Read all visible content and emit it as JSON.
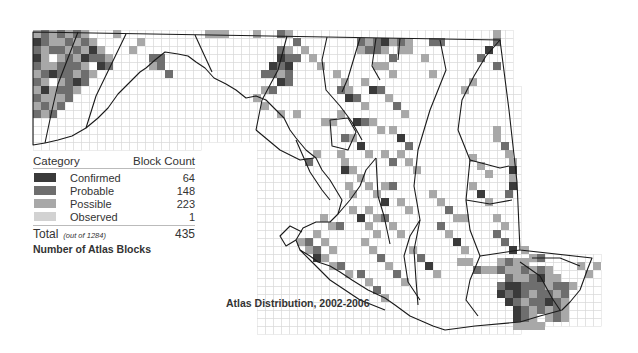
{
  "legend": {
    "header_category": "Category",
    "header_count": "Block Count",
    "rows": [
      {
        "label": "Confirmed",
        "count": "64",
        "color": "#3a3a3a"
      },
      {
        "label": "Probable",
        "count": "148",
        "color": "#6e6e6e"
      },
      {
        "label": "Possible",
        "count": "223",
        "color": "#a8a8a8"
      },
      {
        "label": "Observed",
        "count": "1",
        "color": "#d2d2d2"
      }
    ],
    "total_label": "Total",
    "total_sub": "(out of 1284)",
    "total_count": "435",
    "caption": "Number of Atlas Blocks"
  },
  "map": {
    "caption": "Atlas Distribution, 2002-2006",
    "grid_color": "#d9d9d9",
    "outline_color": "#1a1a1a",
    "cell_size": 8,
    "category_colors": {
      "C": "#3a3a3a",
      "P": "#6e6e6e",
      "S": "#a8a8a8",
      "O": "#d2d2d2"
    },
    "blocks": [
      [
        33,
        30,
        "S"
      ],
      [
        41,
        30,
        "P"
      ],
      [
        49,
        30,
        "S"
      ],
      [
        57,
        30,
        "P"
      ],
      [
        65,
        30,
        "S"
      ],
      [
        73,
        30,
        "P"
      ],
      [
        81,
        30,
        "S"
      ],
      [
        33,
        38,
        "C"
      ],
      [
        41,
        38,
        "P"
      ],
      [
        49,
        38,
        "S"
      ],
      [
        57,
        38,
        "S"
      ],
      [
        65,
        38,
        "P"
      ],
      [
        73,
        38,
        "S"
      ],
      [
        81,
        38,
        "P"
      ],
      [
        89,
        38,
        "S"
      ],
      [
        33,
        46,
        "P"
      ],
      [
        41,
        46,
        "S"
      ],
      [
        49,
        46,
        "P"
      ],
      [
        57,
        46,
        "P"
      ],
      [
        65,
        46,
        "S"
      ],
      [
        73,
        46,
        "P"
      ],
      [
        81,
        46,
        "S"
      ],
      [
        89,
        46,
        "C"
      ],
      [
        97,
        46,
        "S"
      ],
      [
        33,
        54,
        "C"
      ],
      [
        41,
        54,
        "S"
      ],
      [
        57,
        54,
        "S"
      ],
      [
        65,
        54,
        "P"
      ],
      [
        73,
        54,
        "S"
      ],
      [
        81,
        54,
        "C"
      ],
      [
        89,
        54,
        "P"
      ],
      [
        97,
        54,
        "P"
      ],
      [
        105,
        54,
        "S"
      ],
      [
        33,
        62,
        "P"
      ],
      [
        41,
        62,
        "S"
      ],
      [
        49,
        62,
        "S"
      ],
      [
        57,
        62,
        "P"
      ],
      [
        65,
        62,
        "P"
      ],
      [
        73,
        62,
        "P"
      ],
      [
        81,
        62,
        "S"
      ],
      [
        97,
        62,
        "C"
      ],
      [
        105,
        62,
        "P"
      ],
      [
        33,
        70,
        "S"
      ],
      [
        41,
        70,
        "P"
      ],
      [
        49,
        70,
        "C"
      ],
      [
        57,
        70,
        "P"
      ],
      [
        65,
        70,
        "P"
      ],
      [
        73,
        70,
        "S"
      ],
      [
        81,
        70,
        "P"
      ],
      [
        89,
        70,
        "S"
      ],
      [
        33,
        78,
        "P"
      ],
      [
        41,
        78,
        "S"
      ],
      [
        57,
        78,
        "S"
      ],
      [
        65,
        78,
        "P"
      ],
      [
        73,
        78,
        "C"
      ],
      [
        81,
        78,
        "P"
      ],
      [
        33,
        86,
        "S"
      ],
      [
        41,
        86,
        "C"
      ],
      [
        49,
        86,
        "S"
      ],
      [
        57,
        86,
        "P"
      ],
      [
        65,
        86,
        "P"
      ],
      [
        73,
        86,
        "S"
      ],
      [
        33,
        94,
        "P"
      ],
      [
        41,
        94,
        "S"
      ],
      [
        49,
        94,
        "S"
      ],
      [
        57,
        94,
        "S"
      ],
      [
        65,
        94,
        "P"
      ],
      [
        33,
        102,
        "S"
      ],
      [
        41,
        102,
        "P"
      ],
      [
        49,
        102,
        "S"
      ],
      [
        57,
        102,
        "P"
      ],
      [
        33,
        110,
        "P"
      ],
      [
        41,
        110,
        "S"
      ],
      [
        49,
        110,
        "P"
      ],
      [
        113,
        30,
        "S"
      ],
      [
        129,
        46,
        "S"
      ],
      [
        137,
        38,
        "S"
      ],
      [
        149,
        54,
        "P"
      ],
      [
        157,
        54,
        "P"
      ],
      [
        149,
        62,
        "S"
      ],
      [
        157,
        62,
        "P"
      ],
      [
        165,
        70,
        "P"
      ],
      [
        205,
        30,
        "S"
      ],
      [
        213,
        30,
        "S"
      ],
      [
        221,
        30,
        "S"
      ],
      [
        253,
        30,
        "S"
      ],
      [
        277,
        30,
        "P"
      ],
      [
        285,
        30,
        "S"
      ],
      [
        293,
        38,
        "P"
      ],
      [
        277,
        46,
        "P"
      ],
      [
        285,
        46,
        "S"
      ],
      [
        277,
        54,
        "C"
      ],
      [
        285,
        54,
        "P"
      ],
      [
        293,
        54,
        "P"
      ],
      [
        269,
        62,
        "C"
      ],
      [
        277,
        62,
        "P"
      ],
      [
        285,
        62,
        "C"
      ],
      [
        261,
        70,
        "P"
      ],
      [
        269,
        70,
        "P"
      ],
      [
        277,
        70,
        "S"
      ],
      [
        285,
        70,
        "P"
      ],
      [
        277,
        78,
        "C"
      ],
      [
        285,
        78,
        "P"
      ],
      [
        261,
        86,
        "S"
      ],
      [
        269,
        86,
        "P"
      ],
      [
        253,
        94,
        "S"
      ],
      [
        261,
        102,
        "S"
      ],
      [
        277,
        110,
        "S"
      ],
      [
        293,
        110,
        "S"
      ],
      [
        301,
        46,
        "S"
      ],
      [
        309,
        54,
        "S"
      ],
      [
        317,
        62,
        "S"
      ],
      [
        333,
        70,
        "S"
      ],
      [
        341,
        78,
        "S"
      ],
      [
        357,
        38,
        "P"
      ],
      [
        365,
        38,
        "S"
      ],
      [
        373,
        38,
        "P"
      ],
      [
        381,
        38,
        "C"
      ],
      [
        389,
        38,
        "S"
      ],
      [
        397,
        38,
        "P"
      ],
      [
        405,
        38,
        "S"
      ],
      [
        429,
        38,
        "P"
      ],
      [
        437,
        38,
        "P"
      ],
      [
        357,
        46,
        "S"
      ],
      [
        365,
        46,
        "P"
      ],
      [
        373,
        46,
        "P"
      ],
      [
        381,
        46,
        "S"
      ],
      [
        389,
        54,
        "P"
      ],
      [
        397,
        46,
        "S"
      ],
      [
        405,
        46,
        "S"
      ],
      [
        373,
        62,
        "S"
      ],
      [
        381,
        62,
        "S"
      ],
      [
        389,
        70,
        "S"
      ],
      [
        421,
        54,
        "S"
      ],
      [
        429,
        70,
        "S"
      ],
      [
        461,
        86,
        "S"
      ],
      [
        469,
        78,
        "S"
      ],
      [
        493,
        30,
        "S"
      ],
      [
        493,
        38,
        "P"
      ],
      [
        485,
        46,
        "C"
      ],
      [
        477,
        54,
        "P"
      ],
      [
        493,
        62,
        "P"
      ],
      [
        337,
        86,
        "P"
      ],
      [
        345,
        86,
        "S"
      ],
      [
        345,
        94,
        "C"
      ],
      [
        353,
        94,
        "P"
      ],
      [
        361,
        102,
        "S"
      ],
      [
        361,
        78,
        "S"
      ],
      [
        369,
        86,
        "C"
      ],
      [
        377,
        86,
        "P"
      ],
      [
        385,
        94,
        "S"
      ],
      [
        393,
        102,
        "P"
      ],
      [
        401,
        110,
        "S"
      ],
      [
        321,
        118,
        "S"
      ],
      [
        329,
        118,
        "S"
      ],
      [
        337,
        110,
        "S"
      ],
      [
        353,
        118,
        "C"
      ],
      [
        361,
        118,
        "P"
      ],
      [
        369,
        118,
        "S"
      ],
      [
        377,
        126,
        "S"
      ],
      [
        341,
        134,
        "P"
      ],
      [
        349,
        134,
        "S"
      ],
      [
        357,
        142,
        "C"
      ],
      [
        365,
        150,
        "S"
      ],
      [
        381,
        150,
        "S"
      ],
      [
        389,
        158,
        "P"
      ],
      [
        389,
        126,
        "S"
      ],
      [
        397,
        134,
        "C"
      ],
      [
        405,
        142,
        "P"
      ],
      [
        397,
        150,
        "S"
      ],
      [
        405,
        158,
        "S"
      ],
      [
        413,
        166,
        "S"
      ],
      [
        337,
        150,
        "S"
      ],
      [
        341,
        158,
        "S"
      ],
      [
        349,
        166,
        "S"
      ],
      [
        357,
        174,
        "S"
      ],
      [
        365,
        182,
        "S"
      ],
      [
        313,
        150,
        "S"
      ],
      [
        305,
        158,
        "P"
      ],
      [
        341,
        166,
        "C"
      ],
      [
        345,
        182,
        "S"
      ],
      [
        349,
        190,
        "S"
      ],
      [
        381,
        182,
        "S"
      ],
      [
        389,
        182,
        "P"
      ],
      [
        373,
        190,
        "S"
      ],
      [
        381,
        198,
        "C"
      ],
      [
        397,
        198,
        "S"
      ],
      [
        405,
        206,
        "S"
      ],
      [
        365,
        206,
        "S"
      ],
      [
        373,
        214,
        "S"
      ],
      [
        381,
        214,
        "P"
      ],
      [
        389,
        222,
        "S"
      ],
      [
        397,
        230,
        "S"
      ],
      [
        349,
        206,
        "S"
      ],
      [
        357,
        214,
        "C"
      ],
      [
        365,
        222,
        "S"
      ],
      [
        373,
        230,
        "S"
      ],
      [
        320,
        214,
        "S"
      ],
      [
        328,
        222,
        "S"
      ],
      [
        336,
        222,
        "P"
      ],
      [
        313,
        230,
        "S"
      ],
      [
        305,
        238,
        "P"
      ],
      [
        297,
        238,
        "S"
      ],
      [
        305,
        246,
        "S"
      ],
      [
        313,
        246,
        "P"
      ],
      [
        321,
        238,
        "S"
      ],
      [
        329,
        246,
        "S"
      ],
      [
        313,
        254,
        "C"
      ],
      [
        321,
        254,
        "S"
      ],
      [
        329,
        262,
        "S"
      ],
      [
        337,
        262,
        "P"
      ],
      [
        345,
        270,
        "S"
      ],
      [
        361,
        238,
        "S"
      ],
      [
        369,
        246,
        "S"
      ],
      [
        377,
        254,
        "P"
      ],
      [
        385,
        262,
        "S"
      ],
      [
        393,
        270,
        "P"
      ],
      [
        401,
        278,
        "S"
      ],
      [
        409,
        246,
        "S"
      ],
      [
        417,
        254,
        "P"
      ],
      [
        425,
        262,
        "C"
      ],
      [
        433,
        270,
        "S"
      ],
      [
        357,
        270,
        "P"
      ],
      [
        365,
        278,
        "S"
      ],
      [
        373,
        286,
        "P"
      ],
      [
        381,
        294,
        "S"
      ],
      [
        429,
        190,
        "S"
      ],
      [
        437,
        198,
        "S"
      ],
      [
        445,
        206,
        "P"
      ],
      [
        453,
        214,
        "S"
      ],
      [
        461,
        214,
        "S"
      ],
      [
        469,
        182,
        "S"
      ],
      [
        477,
        190,
        "C"
      ],
      [
        485,
        198,
        "S"
      ],
      [
        437,
        222,
        "P"
      ],
      [
        445,
        230,
        "S"
      ],
      [
        453,
        238,
        "C"
      ],
      [
        461,
        246,
        "S"
      ],
      [
        469,
        154,
        "S"
      ],
      [
        477,
        162,
        "S"
      ],
      [
        485,
        170,
        "S"
      ],
      [
        493,
        126,
        "S"
      ],
      [
        493,
        134,
        "S"
      ],
      [
        501,
        142,
        "P"
      ],
      [
        505,
        150,
        "S"
      ],
      [
        509,
        158,
        "S"
      ],
      [
        509,
        166,
        "C"
      ],
      [
        509,
        174,
        "S"
      ],
      [
        509,
        182,
        "C"
      ],
      [
        505,
        190,
        "P"
      ],
      [
        493,
        214,
        "S"
      ],
      [
        501,
        222,
        "S"
      ],
      [
        493,
        230,
        "P"
      ],
      [
        501,
        238,
        "P"
      ],
      [
        509,
        246,
        "C"
      ],
      [
        521,
        246,
        "S"
      ],
      [
        529,
        254,
        "S"
      ],
      [
        537,
        254,
        "P"
      ],
      [
        457,
        258,
        "S"
      ],
      [
        465,
        258,
        "S"
      ],
      [
        473,
        266,
        "P"
      ],
      [
        481,
        266,
        "S"
      ],
      [
        489,
        266,
        "S"
      ],
      [
        497,
        258,
        "S"
      ],
      [
        505,
        258,
        "P"
      ],
      [
        513,
        258,
        "S"
      ],
      [
        521,
        258,
        "S"
      ],
      [
        529,
        266,
        "S"
      ],
      [
        537,
        266,
        "P"
      ],
      [
        545,
        266,
        "S"
      ],
      [
        497,
        266,
        "P"
      ],
      [
        505,
        266,
        "S"
      ],
      [
        513,
        266,
        "S"
      ],
      [
        521,
        266,
        "P"
      ],
      [
        529,
        274,
        "P"
      ],
      [
        537,
        274,
        "C"
      ],
      [
        545,
        274,
        "S"
      ],
      [
        553,
        274,
        "S"
      ],
      [
        505,
        274,
        "P"
      ],
      [
        513,
        274,
        "S"
      ],
      [
        521,
        274,
        "S"
      ],
      [
        545,
        282,
        "S"
      ],
      [
        553,
        282,
        "P"
      ],
      [
        561,
        282,
        "P"
      ],
      [
        569,
        282,
        "S"
      ],
      [
        497,
        282,
        "P"
      ],
      [
        505,
        282,
        "C"
      ],
      [
        513,
        282,
        "C"
      ],
      [
        521,
        282,
        "P"
      ],
      [
        529,
        282,
        "P"
      ],
      [
        537,
        282,
        "P"
      ],
      [
        497,
        290,
        "C"
      ],
      [
        505,
        290,
        "P"
      ],
      [
        513,
        290,
        "C"
      ],
      [
        521,
        290,
        "P"
      ],
      [
        529,
        290,
        "S"
      ],
      [
        537,
        290,
        "P"
      ],
      [
        545,
        290,
        "P"
      ],
      [
        553,
        290,
        "S"
      ],
      [
        561,
        290,
        "P"
      ],
      [
        505,
        298,
        "C"
      ],
      [
        513,
        298,
        "P"
      ],
      [
        521,
        298,
        "S"
      ],
      [
        529,
        298,
        "P"
      ],
      [
        537,
        298,
        "P"
      ],
      [
        545,
        298,
        "C"
      ],
      [
        553,
        298,
        "P"
      ],
      [
        561,
        298,
        "S"
      ],
      [
        513,
        306,
        "C"
      ],
      [
        521,
        306,
        "P"
      ],
      [
        529,
        306,
        "S"
      ],
      [
        537,
        306,
        "P"
      ],
      [
        545,
        306,
        "S"
      ],
      [
        553,
        306,
        "P"
      ],
      [
        561,
        306,
        "S"
      ],
      [
        513,
        314,
        "C"
      ],
      [
        521,
        314,
        "P"
      ],
      [
        529,
        314,
        "S"
      ],
      [
        545,
        314,
        "S"
      ],
      [
        553,
        314,
        "P"
      ],
      [
        561,
        314,
        "S"
      ],
      [
        513,
        322,
        "S"
      ],
      [
        521,
        322,
        "S"
      ],
      [
        529,
        322,
        "S"
      ],
      [
        537,
        322,
        "S"
      ],
      [
        577,
        262,
        "S"
      ],
      [
        585,
        270,
        "S"
      ],
      [
        593,
        262,
        "S"
      ]
    ]
  }
}
